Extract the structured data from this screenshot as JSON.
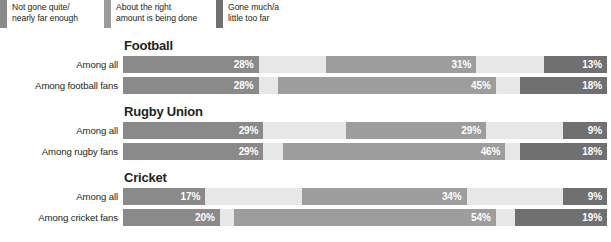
{
  "legend": {
    "items": [
      {
        "label": "Not gone quite/\nnearly far enough",
        "color": "#8a8a8a",
        "key": "not_far_enough"
      },
      {
        "label": "About the right\namount is being done",
        "color": "#9d9d9d",
        "key": "about_right"
      },
      {
        "label": "Gone much/a\nlittle too far",
        "color": "#707070",
        "key": "too_far"
      }
    ]
  },
  "chart_data": {
    "type": "bar",
    "subtype": "stacked-horizontal",
    "title": "",
    "xlabel": "",
    "ylabel": "",
    "xlim": [
      0,
      100
    ],
    "grid": false,
    "legend_position": "top-left",
    "axis_labels_visible": false,
    "value_format": "percent",
    "series": [
      {
        "name": "Not gone quite/nearly far enough",
        "color": "#8a8a8a"
      },
      {
        "name": "About the right amount is being done",
        "color": "#9d9d9d"
      },
      {
        "name": "Gone much/a little too far",
        "color": "#707070"
      }
    ],
    "gap_color": "#e7e7e7",
    "groups": [
      {
        "title": "Football",
        "rows": [
          {
            "label": "Among all",
            "values": [
              28,
              31,
              13
            ],
            "value_labels": [
              "28%",
              "31%",
              "13%"
            ],
            "gaps": [
              14,
              14
            ]
          },
          {
            "label": "Among football fans",
            "values": [
              28,
              45,
              18
            ],
            "value_labels": [
              "28%",
              "45%",
              "18%"
            ],
            "gaps": [
              4,
              5
            ]
          }
        ]
      },
      {
        "title": "Rugby Union",
        "rows": [
          {
            "label": "Among all",
            "values": [
              29,
              29,
              9
            ],
            "value_labels": [
              "29%",
              "29%",
              "9%"
            ],
            "gaps": [
              17,
              16
            ]
          },
          {
            "label": "Among rugby fans",
            "values": [
              29,
              46,
              18
            ],
            "value_labels": [
              "29%",
              "46%",
              "18%"
            ],
            "gaps": [
              4,
              3
            ]
          }
        ]
      },
      {
        "title": "Cricket",
        "rows": [
          {
            "label": "Among all",
            "values": [
              17,
              34,
              9
            ],
            "value_labels": [
              "17%",
              "34%",
              "9%"
            ],
            "gaps": [
              20,
              20
            ]
          },
          {
            "label": "Among cricket fans",
            "values": [
              20,
              54,
              19
            ],
            "value_labels": [
              "20%",
              "54%",
              "19%"
            ],
            "gaps": [
              3,
              4
            ]
          }
        ]
      }
    ]
  }
}
